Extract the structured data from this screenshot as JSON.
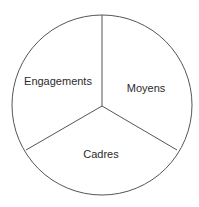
{
  "diagram": {
    "type": "three-segment-circle",
    "stroke_color": "#555555",
    "text_color": "#2b2b2b",
    "background": "#ffffff",
    "segments": [
      {
        "label": "Engagements",
        "position": "upper-left"
      },
      {
        "label": "Moyens",
        "position": "upper-right"
      },
      {
        "label": "Cadres",
        "position": "bottom"
      }
    ]
  }
}
